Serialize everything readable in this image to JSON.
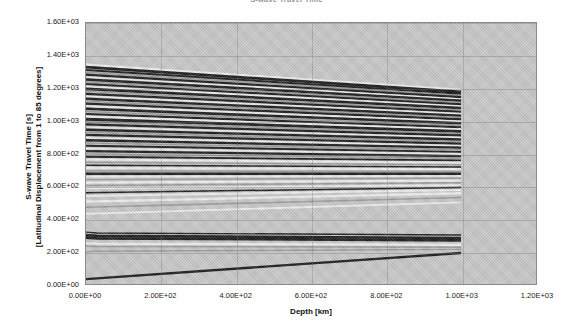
{
  "chart_data": {
    "type": "line",
    "title": "S-wave Travel Time",
    "xlabel": "Depth [km]",
    "ylabel_line1": "S-wave Travel Time [s]",
    "ylabel_line2": "[Latitudinal Displacement from 1 to 85 degrees]",
    "xlim": [
      0,
      1200
    ],
    "ylim": [
      0,
      1600
    ],
    "xticks": [
      0,
      200,
      400,
      600,
      800,
      1000,
      1200
    ],
    "yticks": [
      0,
      200,
      400,
      600,
      800,
      1000,
      1200,
      1400,
      1600
    ],
    "xtick_labels": [
      "0.00E+00",
      "2.00E+02",
      "4.00E+02",
      "6.00E+02",
      "8.00E+02",
      "1.00E+03",
      "1.20E+03"
    ],
    "ytick_labels": [
      "0.00E+00",
      "2.00E+02",
      "4.00E+02",
      "6.00E+02",
      "8.00E+02",
      "1.00E+03",
      "1.20E+03",
      "1.40E+03",
      "1.60E+03"
    ],
    "grid": true,
    "legend": "none",
    "data_x_range": [
      0,
      1000
    ],
    "plot_background_color": "#c9c9c9",
    "trace_dark_color": "#0d0d0d",
    "trace_light_color": "#f2f2f2",
    "frame_color": "#8a8a8a",
    "series": [
      {
        "name": "trace-01",
        "y0": 1345,
        "y1": 1190,
        "shade": "light",
        "weight": 2.2,
        "kink": 0
      },
      {
        "name": "trace-02",
        "y0": 1330,
        "y1": 1178,
        "shade": "dark",
        "weight": 2.8,
        "kink": 0
      },
      {
        "name": "trace-03",
        "y0": 1312,
        "y1": 1166,
        "shade": "dark",
        "weight": 2.0,
        "kink": 0
      },
      {
        "name": "trace-04",
        "y0": 1298,
        "y1": 1156,
        "shade": "mid",
        "weight": 1.6,
        "kink": 0
      },
      {
        "name": "trace-05",
        "y0": 1283,
        "y1": 1146,
        "shade": "dark",
        "weight": 2.2,
        "kink": 0
      },
      {
        "name": "trace-06",
        "y0": 1268,
        "y1": 1134,
        "shade": "light",
        "weight": 1.4,
        "kink": 0
      },
      {
        "name": "trace-07",
        "y0": 1254,
        "y1": 1124,
        "shade": "dark",
        "weight": 2.4,
        "kink": 0
      },
      {
        "name": "trace-08",
        "y0": 1240,
        "y1": 1113,
        "shade": "mid",
        "weight": 1.5,
        "kink": 0
      },
      {
        "name": "trace-09",
        "y0": 1226,
        "y1": 1102,
        "shade": "dark",
        "weight": 2.0,
        "kink": 0
      },
      {
        "name": "trace-10",
        "y0": 1211,
        "y1": 1090,
        "shade": "light",
        "weight": 1.6,
        "kink": 0
      },
      {
        "name": "trace-11",
        "y0": 1196,
        "y1": 1079,
        "shade": "dark",
        "weight": 2.6,
        "kink": 0
      },
      {
        "name": "trace-12",
        "y0": 1181,
        "y1": 1067,
        "shade": "mid",
        "weight": 1.4,
        "kink": 0
      },
      {
        "name": "trace-13",
        "y0": 1166,
        "y1": 1056,
        "shade": "dark",
        "weight": 2.2,
        "kink": 0
      },
      {
        "name": "trace-14",
        "y0": 1151,
        "y1": 1044,
        "shade": "light",
        "weight": 1.5,
        "kink": 0
      },
      {
        "name": "trace-15",
        "y0": 1136,
        "y1": 1032,
        "shade": "dark",
        "weight": 2.4,
        "kink": 0
      },
      {
        "name": "trace-16",
        "y0": 1121,
        "y1": 1021,
        "shade": "mid",
        "weight": 1.5,
        "kink": 0
      },
      {
        "name": "trace-17",
        "y0": 1106,
        "y1": 1009,
        "shade": "dark",
        "weight": 2.2,
        "kink": 0
      },
      {
        "name": "trace-18",
        "y0": 1090,
        "y1": 997,
        "shade": "light",
        "weight": 1.8,
        "kink": 0
      },
      {
        "name": "trace-19",
        "y0": 1074,
        "y1": 985,
        "shade": "dark",
        "weight": 2.6,
        "kink": 0
      },
      {
        "name": "trace-20",
        "y0": 1058,
        "y1": 972,
        "shade": "mid",
        "weight": 1.5,
        "kink": 0
      },
      {
        "name": "trace-21",
        "y0": 1042,
        "y1": 960,
        "shade": "dark",
        "weight": 2.2,
        "kink": 0
      },
      {
        "name": "trace-22",
        "y0": 1026,
        "y1": 948,
        "shade": "light",
        "weight": 2.4,
        "kink": 0
      },
      {
        "name": "trace-23",
        "y0": 1010,
        "y1": 936,
        "shade": "dark",
        "weight": 2.8,
        "kink": 0
      },
      {
        "name": "trace-24",
        "y0": 994,
        "y1": 923,
        "shade": "mid",
        "weight": 1.5,
        "kink": 0
      },
      {
        "name": "trace-25",
        "y0": 978,
        "y1": 911,
        "shade": "dark",
        "weight": 2.2,
        "kink": 0
      },
      {
        "name": "trace-26",
        "y0": 962,
        "y1": 899,
        "shade": "light",
        "weight": 1.4,
        "kink": 0
      },
      {
        "name": "trace-27",
        "y0": 946,
        "y1": 886,
        "shade": "dark",
        "weight": 2.4,
        "kink": 0
      },
      {
        "name": "trace-28",
        "y0": 930,
        "y1": 874,
        "shade": "mid",
        "weight": 1.6,
        "kink": 0
      },
      {
        "name": "trace-29",
        "y0": 914,
        "y1": 861,
        "shade": "dark",
        "weight": 2.2,
        "kink": 0
      },
      {
        "name": "trace-30",
        "y0": 897,
        "y1": 848,
        "shade": "light",
        "weight": 1.5,
        "kink": 0
      },
      {
        "name": "trace-31",
        "y0": 881,
        "y1": 836,
        "shade": "dark",
        "weight": 2.4,
        "kink": 0
      },
      {
        "name": "trace-32",
        "y0": 864,
        "y1": 823,
        "shade": "mid",
        "weight": 1.4,
        "kink": 0
      },
      {
        "name": "trace-33",
        "y0": 848,
        "y1": 810,
        "shade": "dark",
        "weight": 2.0,
        "kink": 0
      },
      {
        "name": "trace-34",
        "y0": 831,
        "y1": 797,
        "shade": "light",
        "weight": 1.6,
        "kink": 0
      },
      {
        "name": "trace-35",
        "y0": 814,
        "y1": 784,
        "shade": "dark",
        "weight": 2.2,
        "kink": 0
      },
      {
        "name": "trace-36",
        "y0": 797,
        "y1": 771,
        "shade": "mid",
        "weight": 1.4,
        "kink": 0
      },
      {
        "name": "trace-37",
        "y0": 780,
        "y1": 758,
        "shade": "dark",
        "weight": 1.8,
        "kink": 0
      },
      {
        "name": "trace-38",
        "y0": 763,
        "y1": 744,
        "shade": "light",
        "weight": 2.0,
        "kink": 0
      },
      {
        "name": "trace-39",
        "y0": 746,
        "y1": 731,
        "shade": "mid",
        "weight": 1.4,
        "kink": 0
      },
      {
        "name": "trace-40",
        "y0": 728,
        "y1": 717,
        "shade": "dark",
        "weight": 1.6,
        "kink": 0
      },
      {
        "name": "trace-41",
        "y0": 711,
        "y1": 704,
        "shade": "light",
        "weight": 2.2,
        "kink": 0
      },
      {
        "name": "trace-42",
        "y0": 693,
        "y1": 690,
        "shade": "mid",
        "weight": 1.5,
        "kink": 0
      },
      {
        "name": "trace-43",
        "y0": 676,
        "y1": 676,
        "shade": "dark",
        "weight": 2.6,
        "kink": 0
      },
      {
        "name": "trace-44",
        "y0": 658,
        "y1": 662,
        "shade": "light",
        "weight": 1.6,
        "kink": 0
      },
      {
        "name": "trace-45",
        "y0": 640,
        "y1": 648,
        "shade": "mid",
        "weight": 1.4,
        "kink": 0
      },
      {
        "name": "trace-46",
        "y0": 622,
        "y1": 634,
        "shade": "light",
        "weight": 2.2,
        "kink": 0
      },
      {
        "name": "trace-47",
        "y0": 604,
        "y1": 620,
        "shade": "mid",
        "weight": 1.5,
        "kink": 0
      },
      {
        "name": "trace-48",
        "y0": 586,
        "y1": 606,
        "shade": "light",
        "weight": 1.8,
        "kink": 0
      },
      {
        "name": "trace-49",
        "y0": 560,
        "y1": 591,
        "shade": "dark",
        "weight": 1.5,
        "kink": 0
      },
      {
        "name": "trace-50",
        "y0": 540,
        "y1": 576,
        "shade": "light",
        "weight": 2.0,
        "kink": 0
      },
      {
        "name": "trace-51",
        "y0": 505,
        "y1": 556,
        "shade": "light",
        "weight": 2.4,
        "kink": 0
      },
      {
        "name": "trace-52",
        "y0": 470,
        "y1": 530,
        "shade": "mid",
        "weight": 1.6,
        "kink": 0
      },
      {
        "name": "trace-53",
        "y0": 430,
        "y1": 500,
        "shade": "light",
        "weight": 1.8,
        "kink": 0
      },
      {
        "name": "trace-54",
        "y0": 318,
        "y1": 300,
        "shade": "dark",
        "weight": 1.5,
        "kink": 60
      },
      {
        "name": "trace-55",
        "y0": 300,
        "y1": 282,
        "shade": "dark",
        "weight": 2.6,
        "kink": 60
      },
      {
        "name": "trace-56",
        "y0": 285,
        "y1": 268,
        "shade": "dark",
        "weight": 2.8,
        "kink": 60
      },
      {
        "name": "trace-57",
        "y0": 250,
        "y1": 240,
        "shade": "light",
        "weight": 2.2,
        "kink": 55
      },
      {
        "name": "trace-58",
        "y0": 232,
        "y1": 225,
        "shade": "mid",
        "weight": 1.5,
        "kink": 55
      },
      {
        "name": "trace-59",
        "y0": 196,
        "y1": 212,
        "shade": "mid",
        "weight": 1.4,
        "kink": 40
      },
      {
        "name": "trace-60",
        "y0": 30,
        "y1": 190,
        "shade": "dark",
        "weight": 2.4,
        "kink": 0
      }
    ]
  }
}
